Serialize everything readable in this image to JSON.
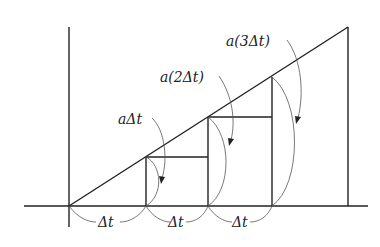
{
  "diagram": {
    "type": "staircase-under-line",
    "labels": {
      "step1_height": "aΔt",
      "step2_height": "a(2Δt)",
      "step3_height": "a(3Δt)",
      "interval1": "Δt",
      "interval2": "Δt",
      "interval3": "Δt"
    },
    "colors": {
      "line": "#222222",
      "arc": "#555555",
      "background": "#ffffff"
    },
    "geometry": {
      "origin": [
        69,
        206
      ],
      "line_end": [
        348,
        27
      ],
      "step_x": [
        146,
        208,
        272
      ],
      "step_top_y": [
        157,
        117,
        77
      ]
    }
  }
}
